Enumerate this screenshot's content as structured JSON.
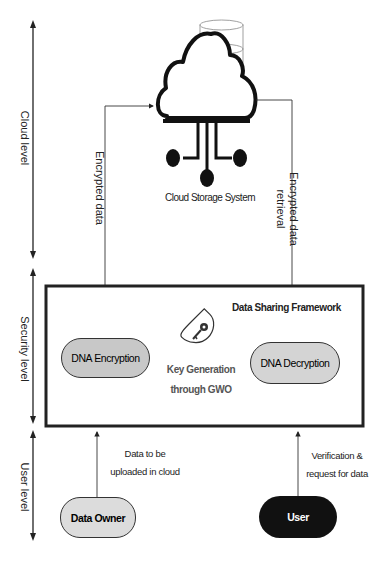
{
  "diagram": {
    "levels": [
      {
        "id": "cloud",
        "label": "Cloud level"
      },
      {
        "id": "security",
        "label": "Security level"
      },
      {
        "id": "user",
        "label": "User level"
      }
    ],
    "cloud": {
      "label": "Cloud Storage System",
      "icon": "cloud-database-icon"
    },
    "framework": {
      "title": "Data Sharing Framework",
      "encryption": "DNA Encryption",
      "decryption": "DNA Decryption",
      "key_generation_line1": "Key Generation",
      "key_generation_line2": "through GWO",
      "key_icon": "key-icon"
    },
    "edges": {
      "encrypted_data": "Encrypted data",
      "encrypted_retrieval_line1": "Encrypted data",
      "encrypted_retrieval_line2": "retrieval",
      "upload_line1": "Data to be",
      "upload_line2": "uploaded in cloud",
      "request_line1": "Verification &",
      "request_line2": "request for data"
    },
    "actors": {
      "owner": "Data Owner",
      "user": "User"
    },
    "colors": {
      "pill_fill": "#c8c8c8",
      "owner_fill": "#dcdcdc",
      "user_fill": "#111111",
      "key_text": "#555555"
    }
  }
}
